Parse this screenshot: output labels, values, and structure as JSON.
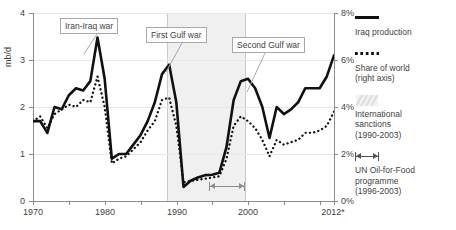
{
  "chart_data": {
    "type": "line",
    "title": "",
    "xlabel": "",
    "ylabel": "mb/d",
    "ylabel_right": "%",
    "xlim": [
      1970,
      2012
    ],
    "ylim": [
      0,
      4
    ],
    "ylim_right": [
      0,
      8
    ],
    "grid": true,
    "legend_position": "right",
    "x_tick_labels": [
      "1970",
      "1980",
      "1990",
      "2000",
      "2012*"
    ],
    "x_tick_values": [
      1970,
      1980,
      1990,
      2000,
      2012
    ],
    "x_minor_tick_values": [
      1975,
      1985,
      1995,
      2005,
      2010
    ],
    "y_tick_labels": [
      "0",
      "1",
      "2",
      "3",
      "4"
    ],
    "y_tick_values": [
      0,
      1,
      2,
      3,
      4
    ],
    "y_right_tick_labels": [
      "0%",
      "2%",
      "4%",
      "6%",
      "8%"
    ],
    "y_right_tick_values": [
      0,
      2,
      4,
      6,
      8
    ],
    "x": [
      1970,
      1971,
      1972,
      1973,
      1974,
      1975,
      1976,
      1977,
      1978,
      1979,
      1980,
      1981,
      1982,
      1983,
      1984,
      1985,
      1986,
      1987,
      1988,
      1989,
      1990,
      1991,
      1992,
      1993,
      1994,
      1995,
      1996,
      1997,
      1998,
      1999,
      2000,
      2001,
      2002,
      2003,
      2004,
      2005,
      2006,
      2007,
      2008,
      2009,
      2010,
      2011,
      2012
    ],
    "series": [
      {
        "name": "Iraq production",
        "units": "mb/d",
        "axis": "left",
        "style": "solid",
        "color": "#111111",
        "values": [
          1.7,
          1.7,
          1.45,
          2.0,
          1.95,
          2.25,
          2.4,
          2.35,
          2.55,
          3.48,
          2.6,
          0.9,
          1.0,
          1.0,
          1.2,
          1.4,
          1.7,
          2.1,
          2.7,
          2.9,
          2.1,
          0.3,
          0.43,
          0.5,
          0.55,
          0.56,
          0.6,
          1.15,
          2.15,
          2.55,
          2.6,
          2.4,
          2.0,
          1.34,
          2.0,
          1.85,
          1.95,
          2.1,
          2.4,
          2.4,
          2.4,
          2.65,
          3.1
        ]
      },
      {
        "name": "Share of world (right axis)",
        "units": "%",
        "axis": "right",
        "style": "dotted",
        "color": "#111111",
        "values": [
          3.4,
          3.6,
          3.1,
          3.7,
          3.9,
          4.1,
          4.0,
          4.3,
          4.2,
          5.3,
          4.0,
          1.6,
          1.8,
          1.9,
          2.2,
          2.5,
          3.0,
          3.4,
          4.3,
          4.4,
          3.2,
          0.8,
          0.85,
          0.9,
          0.95,
          1.0,
          1.05,
          1.8,
          3.2,
          3.6,
          3.4,
          3.1,
          2.6,
          1.9,
          2.6,
          2.4,
          2.5,
          2.6,
          2.9,
          2.9,
          3.0,
          3.2,
          3.8
        ]
      }
    ],
    "bands": [
      {
        "name": "International sanctions",
        "from": 1990,
        "to": 2003,
        "color": "#f0f0f0"
      }
    ],
    "spans": [
      {
        "name": "UN Oil-for-Food programme",
        "from": 1996,
        "to": 2003
      }
    ],
    "annotations": [
      {
        "id": "iran-iraq-war",
        "label": "Iran-Iraq war",
        "points_to_year": 1980
      },
      {
        "id": "first-gulf-war",
        "label": "First Gulf war",
        "points_to_year": 1990
      },
      {
        "id": "second-gulf-war",
        "label": "Second Gulf war",
        "points_to_year": 2003
      }
    ]
  },
  "legend": {
    "items": [
      {
        "id": "iraq-production",
        "marker": "solid-line-icon",
        "lines": [
          "Iraq production"
        ]
      },
      {
        "id": "share-of-world",
        "marker": "dotted-line-icon",
        "lines": [
          "Share of world",
          "(right axis)"
        ]
      },
      {
        "id": "intl-sanctions",
        "marker": "hatched-band-icon",
        "lines": [
          "International",
          "sanctions",
          "(1990-2003)"
        ]
      },
      {
        "id": "oil-for-food",
        "marker": "span-arrow-icon",
        "lines": [
          "UN Oil-for-Food",
          "programme",
          "(1996-2003)"
        ]
      }
    ]
  }
}
